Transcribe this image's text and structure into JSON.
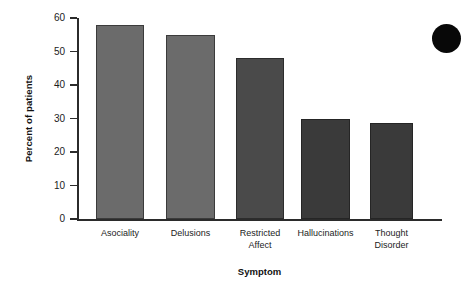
{
  "chart_data": {
    "type": "bar",
    "title": "",
    "xlabel": "Symptom",
    "ylabel": "Percent of patients",
    "categories": [
      "Asociality",
      "Delusions",
      "Restricted Affect",
      "Hallucinations",
      "Thought Disorder"
    ],
    "values": [
      58,
      55,
      48,
      30,
      28.7
    ],
    "ylim": [
      0,
      60
    ],
    "yticks": [
      0,
      10,
      20,
      30,
      40,
      50,
      60
    ],
    "ytick_labels": [
      "0",
      "10",
      "20",
      "30",
      "40",
      "50",
      "60"
    ],
    "grid": false,
    "legend": null,
    "bar_colors": [
      "#6b6b6b",
      "#6b6b6b",
      "#4a4a4a",
      "#3a3a3a",
      "#3a3a3a"
    ],
    "series": [
      {
        "name": "Percent of patients",
        "values": [
          58,
          55,
          48,
          30,
          28.7
        ]
      }
    ]
  },
  "axes": {
    "y_title": "Percent of patients",
    "x_title": "Symptom"
  },
  "category_labels": [
    {
      "line1": "Asociality",
      "line2": ""
    },
    {
      "line1": "Delusions",
      "line2": ""
    },
    {
      "line1": "Restricted",
      "line2": "Affect"
    },
    {
      "line1": "Hallucinations",
      "line2": ""
    },
    {
      "line1": "Thought",
      "line2": "Disorder"
    }
  ],
  "marker": {
    "name": "corner-dot",
    "color": "#080808"
  }
}
